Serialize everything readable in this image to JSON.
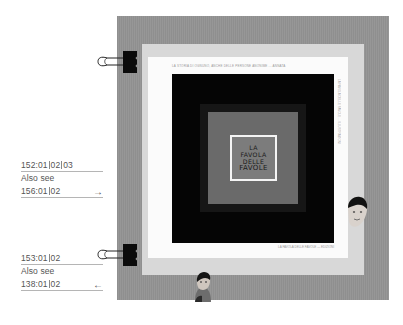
{
  "references": [
    {
      "code_parts": [
        "152:01",
        "02",
        "03"
      ],
      "also_see_label": "Also see",
      "link_parts": [
        "156:01",
        "02"
      ],
      "arrow": "→",
      "arrow_direction": "right"
    },
    {
      "code_parts": [
        "153:01",
        "02"
      ],
      "also_see_label": "Also see",
      "link_parts": [
        "138:01",
        "02"
      ],
      "arrow": "←",
      "arrow_direction": "left"
    }
  ],
  "artwork": {
    "title_lines": [
      "LA",
      "FAVOLA",
      "DELLE",
      "FAVOLE"
    ],
    "caption_top": "LA STORIA DI OGNUNO, ANCHE DELLE PERSONE ANONIME ... ANNATA",
    "caption_side": "LA FAVOLA DELLE FAVOLE ... ILLUSTRAZIONI",
    "caption_bottom": "LA FAVOLA DELLE FAVOLE — EDIZIONI",
    "colors": {
      "board": "#939393",
      "mat": "#d8d8d8",
      "paper": "#fbfbfb",
      "frame_black": "#050505",
      "inner_gray": "#6a6a6a",
      "title_card": "#7c7c7c"
    }
  },
  "clips": [
    {
      "position": "top-left",
      "icon": "binder-clip-icon"
    },
    {
      "position": "bottom-left",
      "icon": "binder-clip-icon"
    }
  ]
}
